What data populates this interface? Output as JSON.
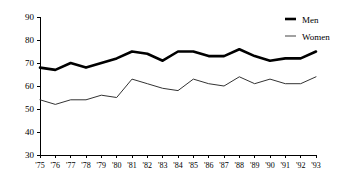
{
  "chart_data": {
    "type": "line",
    "title": "",
    "subtitle": "",
    "xlabel": "",
    "ylabel": "",
    "ylim": [
      30,
      90
    ],
    "yticks": [
      30,
      40,
      50,
      60,
      70,
      80,
      90
    ],
    "grid": false,
    "legend_position": "top-right",
    "categories": [
      "'75",
      "'76",
      "'77",
      "'78",
      "'79",
      "'80",
      "'81",
      "'82",
      "'83",
      "'84",
      "'85",
      "'86",
      "'87",
      "'88",
      "'89",
      "'90",
      "'91",
      "'92",
      "'93"
    ],
    "x": [
      1975,
      1976,
      1977,
      1978,
      1979,
      1980,
      1981,
      1982,
      1983,
      1984,
      1985,
      1986,
      1987,
      1988,
      1989,
      1990,
      1991,
      1992,
      1993
    ],
    "series": [
      {
        "name": "Men",
        "style": "thick",
        "color": "#000000",
        "values": [
          68,
          67,
          70,
          68,
          70,
          72,
          75,
          74,
          71,
          75,
          75,
          73,
          73,
          76,
          73,
          71,
          72,
          72,
          75
        ]
      },
      {
        "name": "Women",
        "style": "thin",
        "color": "#333333",
        "values": [
          54,
          52,
          54,
          54,
          56,
          55,
          63,
          61,
          59,
          58,
          63,
          61,
          60,
          64,
          61,
          63,
          61,
          61,
          64
        ]
      }
    ]
  },
  "legend": {
    "items": [
      {
        "label": "Men",
        "swatch": "thick-line-swatch"
      },
      {
        "label": "Women",
        "swatch": "thin-line-swatch"
      }
    ]
  },
  "axes": {
    "y_tick_labels": [
      "90",
      "80",
      "70",
      "60",
      "50",
      "40",
      "30"
    ],
    "x_tick_labels": [
      "'75",
      "'76",
      "'77",
      "'78",
      "'79",
      "'80",
      "'81",
      "'82",
      "'83",
      "'84",
      "'85",
      "'86",
      "'87",
      "'88",
      "'89",
      "'90",
      "'91",
      "'92",
      "'93"
    ]
  }
}
